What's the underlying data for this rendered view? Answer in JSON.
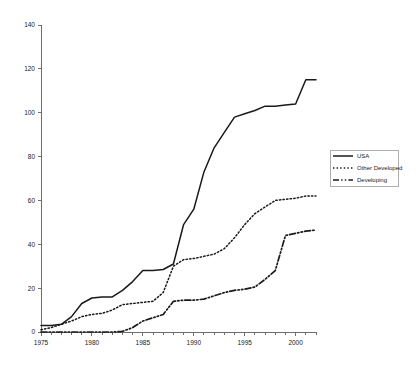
{
  "chart_data": {
    "type": "line",
    "title": "",
    "subtitle": "",
    "xlabel": "",
    "ylabel": "",
    "xlim": [
      1975,
      2002
    ],
    "ylim": [
      0,
      140
    ],
    "grid": false,
    "legend_position": "right",
    "y_ticks": [
      0,
      20,
      40,
      60,
      80,
      100,
      120,
      140
    ],
    "y_tick_labels": [
      "0",
      "20",
      "40",
      "60",
      "80",
      "100",
      "120",
      "140"
    ],
    "x_ticks": [
      1975,
      1980,
      1985,
      1990,
      1995,
      2000
    ],
    "x_tick_labels": [
      "1975",
      "1980",
      "1985",
      "1990",
      "1995",
      "2000"
    ],
    "x_minor_tick_step": 1,
    "x": [
      1975,
      1976,
      1977,
      1978,
      1979,
      1980,
      1981,
      1982,
      1983,
      1984,
      1985,
      1986,
      1987,
      1988,
      1989,
      1990,
      1991,
      1992,
      1993,
      1994,
      1995,
      1996,
      1997,
      1998,
      1999,
      2000,
      2001,
      2002
    ],
    "series": [
      {
        "name": "USA",
        "style": "solid",
        "color": "#1a1a1a",
        "values": [
          3,
          3,
          3.5,
          7,
          13,
          15.5,
          16,
          16,
          19,
          23,
          28,
          28,
          28.5,
          31,
          49,
          56,
          73,
          84,
          91,
          98,
          99.5,
          101,
          103,
          103,
          103.5,
          104,
          115,
          115
        ]
      },
      {
        "name": "Other Developed",
        "style": "dotted",
        "color": "#1a1a1a",
        "values": [
          1,
          2,
          3.5,
          5,
          7,
          8,
          8.5,
          10,
          12.5,
          13,
          13.5,
          14,
          18,
          30,
          33,
          33.5,
          34.5,
          35.5,
          38,
          43,
          49,
          54,
          57,
          60,
          60.5,
          61,
          62,
          62
        ]
      },
      {
        "name": "Developing",
        "style": "dash-dot",
        "color": "#1a1a1a",
        "values": [
          0,
          0,
          0,
          0,
          0,
          0,
          0,
          0,
          0.3,
          2,
          5,
          6.5,
          8,
          14,
          14.5,
          14.5,
          15,
          16.5,
          18,
          19,
          19.5,
          20.5,
          24,
          28,
          44,
          45,
          46,
          46.5
        ]
      }
    ],
    "legend": [
      {
        "label": "USA",
        "style": "solid"
      },
      {
        "label": "Other Developed",
        "style": "dotted"
      },
      {
        "label": "Developing",
        "style": "dash-dot"
      }
    ]
  },
  "plot_geometry": {
    "left": 41,
    "right": 316,
    "top": 25,
    "bottom": 332
  },
  "legend_geometry": {
    "left": 330,
    "top": 150,
    "width": 68,
    "height": 36
  }
}
